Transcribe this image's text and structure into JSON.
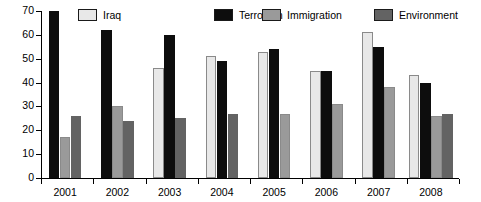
{
  "chart_data": {
    "type": "bar",
    "title": "",
    "subtitle": "",
    "xlabel": "",
    "ylabel": "",
    "categories": [
      "2001",
      "2002",
      "2003",
      "2004",
      "2005",
      "2006",
      "2007",
      "2008"
    ],
    "ylim": [
      0,
      70
    ],
    "yticks": [
      0,
      10,
      20,
      30,
      40,
      50,
      60,
      70
    ],
    "ytick_labels": [
      "0",
      "10",
      "20",
      "30",
      "40",
      "50",
      "60",
      "70"
    ],
    "grid": false,
    "legend_position": "top",
    "series": [
      {
        "name": "Iraq",
        "color": "#e8e8e8",
        "values": [
          null,
          null,
          46,
          51,
          53,
          45,
          61,
          43
        ]
      },
      {
        "name": "Terrorism",
        "color": "#0d0d0d",
        "values": [
          70,
          62,
          60,
          49,
          54,
          45,
          55,
          40
        ]
      },
      {
        "name": "Immigration",
        "color": "#9a9a9a",
        "values": [
          17,
          30,
          null,
          null,
          27,
          31,
          38,
          26
        ]
      },
      {
        "name": "Environment",
        "color": "#636363",
        "values": [
          26,
          24,
          25,
          27,
          null,
          null,
          null,
          27
        ]
      }
    ]
  },
  "legend": {
    "items": [
      {
        "label": "Iraq",
        "color": "#e8e8e8"
      },
      {
        "label": "Terrorism",
        "color": "#0d0d0d"
      },
      {
        "label": "Immigration",
        "color": "#9a9a9a"
      },
      {
        "label": "Environment",
        "color": "#636363"
      }
    ]
  },
  "axis": {
    "y_labels": [
      "70",
      "60",
      "50",
      "40",
      "30",
      "20",
      "10",
      "0"
    ],
    "x_labels": [
      "2001",
      "2002",
      "2003",
      "2004",
      "2005",
      "2006",
      "2007",
      "2008"
    ]
  }
}
